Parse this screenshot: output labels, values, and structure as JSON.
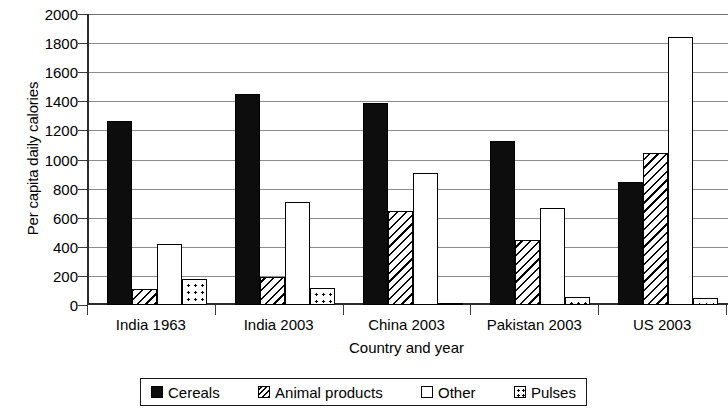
{
  "chart_data": {
    "type": "bar",
    "title": "",
    "xlabel": "Country and year",
    "ylabel": "Per capita daily calories",
    "categories": [
      "India 1963",
      "India 2003",
      "China 2003",
      "Pakistan 2003",
      "US 2003"
    ],
    "series": [
      {
        "name": "Cereals",
        "pattern": "solid-black",
        "values": [
          1265,
          1450,
          1385,
          1130,
          845
        ]
      },
      {
        "name": "Animal products",
        "pattern": "diagonal-hatch",
        "values": [
          110,
          190,
          645,
          450,
          1045
        ]
      },
      {
        "name": "Other",
        "pattern": "empty-white",
        "values": [
          420,
          705,
          905,
          670,
          1840
        ]
      },
      {
        "name": "Pulses",
        "pattern": "dotted",
        "values": [
          180,
          115,
          15,
          55,
          45
        ]
      }
    ],
    "ylim": [
      0,
      2000
    ],
    "ytick_step": 200,
    "yticks": [
      "0",
      "200",
      "400",
      "600",
      "800",
      "1000",
      "1200",
      "1400",
      "1600",
      "1800",
      "2000"
    ],
    "grid": "horizontal",
    "legend_position": "bottom",
    "legend_entries": [
      "Cereals",
      "Animal products",
      "Other",
      "Pulses"
    ],
    "colors": {
      "ink": "#000000",
      "grid": "#8d8d8d",
      "axis": "#2b2b2b",
      "background": "#ffffff"
    }
  }
}
